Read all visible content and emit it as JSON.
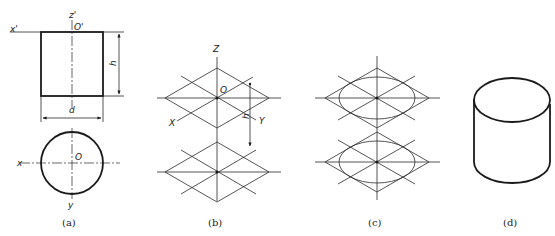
{
  "figure": {
    "panels": [
      {
        "id": "a",
        "caption": "(a)",
        "labels": {
          "z_axis": "z'",
          "origin_top": "O'",
          "x_axis_top": "x'",
          "height": "h",
          "diameter": "d",
          "x_axis": "x",
          "origin": "O",
          "y_axis": "y"
        }
      },
      {
        "id": "b",
        "caption": "(b)",
        "labels": {
          "z_axis": "Z",
          "origin": "O",
          "x_axis": "X",
          "y_axis": "Y",
          "height": "h"
        }
      },
      {
        "id": "c",
        "caption": "(c)"
      },
      {
        "id": "d",
        "caption": "(d)"
      }
    ],
    "colors": {
      "line": "#1a1a1a",
      "background": "#ffffff"
    }
  }
}
